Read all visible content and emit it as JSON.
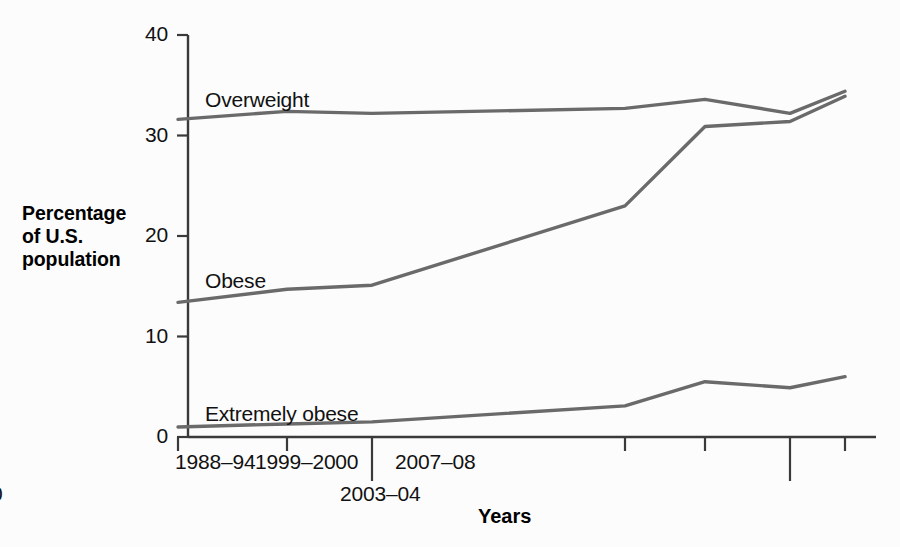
{
  "chart_data": {
    "type": "line",
    "title": "",
    "xlabel": "Years",
    "ylabel": "Percentage of U.S. population",
    "ylabel_lines": [
      "Percentage",
      "of U.S.",
      "population"
    ],
    "ylim": [
      0,
      40
    ],
    "yticks": [
      0,
      10,
      20,
      30,
      40
    ],
    "ytick_labels": [
      "0",
      "10",
      "20",
      "30",
      "40"
    ],
    "grid": false,
    "legend": "inline-series-labels",
    "categories": [
      "1960–62",
      "1971–74",
      "1976–80",
      "1988–94",
      "1999–2000",
      "2003–04",
      "2007–08"
    ],
    "category_rows": [
      0,
      0,
      1,
      0,
      0,
      1,
      0
    ],
    "x_positions": [
      178,
      287,
      372,
      625,
      705,
      790,
      845
    ],
    "series": [
      {
        "name": "Overweight",
        "color": "#6a6a6a",
        "values": [
          31.6,
          32.4,
          32.2,
          32.7,
          33.6,
          32.2,
          34.4
        ],
        "label_x": 205,
        "label_y": 88
      },
      {
        "name": "Obese",
        "color": "#6a6a6a",
        "values": [
          13.4,
          14.7,
          15.1,
          23.0,
          30.9,
          31.4,
          33.9
        ],
        "label_x": 205,
        "label_y": 269
      },
      {
        "name": "Extremely obese",
        "color": "#6a6a6a",
        "values": [
          1.0,
          1.3,
          1.5,
          3.1,
          5.5,
          4.9,
          6.0
        ],
        "label_x": 205,
        "label_y": 402
      }
    ],
    "annotations": []
  },
  "axes": {
    "axis_color": "#3a3a3a",
    "line_color": "#6a6a6a",
    "background": "#fcfcfc"
  }
}
